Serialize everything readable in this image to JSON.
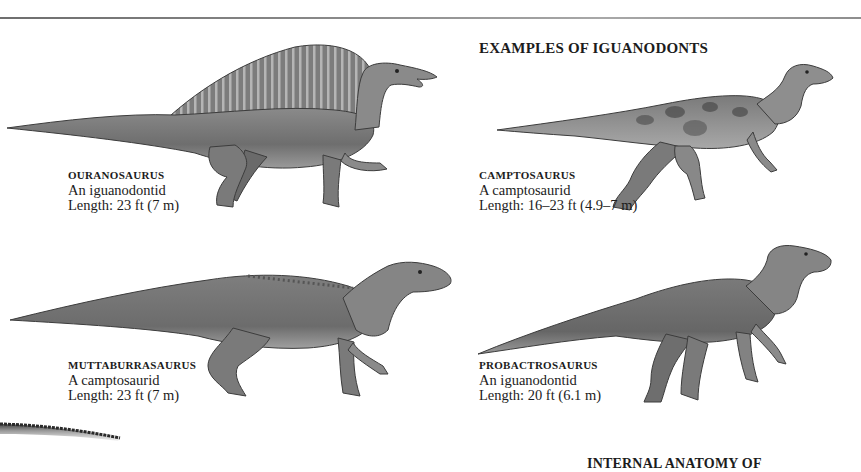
{
  "page": {
    "section_title": "EXAMPLES OF IGUANODONTS",
    "bottom_heading_partial": "INTERNAL ANATOMY OF"
  },
  "dinosaurs": [
    {
      "name": "OURANOSAURUS",
      "family": "An iguanodontid",
      "length": "Length: 23 ft (7 m)",
      "illustration": "ouranosaurus-illustration"
    },
    {
      "name": "CAMPTOSAURUS",
      "family": "A camptosaurid",
      "length": "Length: 16–23 ft (4.9–7 m)",
      "illustration": "camptosaurus-illustration"
    },
    {
      "name": "MUTTABURRASAURUS",
      "family": "A camptosaurid",
      "length": "Length: 23 ft (7 m)",
      "illustration": "muttaburrasaurus-illustration"
    },
    {
      "name": "PROBACTROSAURUS",
      "family": "An iguanodontid",
      "length": "Length: 20 ft (6.1 m)",
      "illustration": "probactrosaurus-illustration"
    }
  ],
  "colors": {
    "text": "#1c1c1c",
    "illustration_dark": "#3c3c3c",
    "illustration_mid": "#7a7a7a",
    "illustration_light": "#b8b8b8",
    "rule": "#8a8a8a"
  }
}
